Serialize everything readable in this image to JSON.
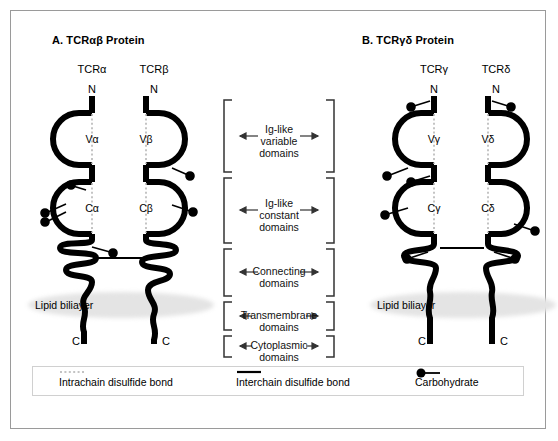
{
  "figure": {
    "panels": [
      {
        "id": "A",
        "title": "A.  TCRαβ Protein",
        "chains": [
          {
            "name": "TCRα",
            "n_terminus": "N",
            "c_terminus": "C",
            "variable_domain": "Vα",
            "constant_domain": "Cα"
          },
          {
            "name": "TCRβ",
            "n_terminus": "N",
            "c_terminus": "C",
            "variable_domain": "Vβ",
            "constant_domain": "Cβ"
          }
        ],
        "membrane_label": "Lipid biliayer"
      },
      {
        "id": "B",
        "title": "B.  TCRγδ Protein",
        "chains": [
          {
            "name": "TCRγ",
            "n_terminus": "N",
            "c_terminus": "C",
            "variable_domain": "Vγ",
            "constant_domain": "Cγ"
          },
          {
            "name": "TCRδ",
            "n_terminus": "N",
            "c_terminus": "C",
            "variable_domain": "Vδ",
            "constant_domain": "Cδ"
          }
        ],
        "membrane_label": "Lipid biliayer"
      }
    ],
    "domain_annotations": [
      {
        "line1": "Ig-like",
        "line2": "variable",
        "line3": "domains"
      },
      {
        "line1": "Ig-like",
        "line2": "constant",
        "line3": "domains"
      },
      {
        "line1": "Connecting",
        "line2": "domains",
        "line3": ""
      },
      {
        "line1": "Transmembrane",
        "line2": "domains",
        "line3": ""
      },
      {
        "line1": "Cytoplasmic",
        "line2": "domains",
        "line3": ""
      }
    ],
    "legend": [
      {
        "symbol": "dotted-line",
        "label": "Intrachain disulfide bond"
      },
      {
        "symbol": "solid-line",
        "label": "Interchain disulfide bond"
      },
      {
        "symbol": "filled-circle-stem",
        "label": "Carbohydrate"
      }
    ],
    "colors": {
      "chain_stroke": "#000000",
      "membrane_band": "#e4e4e4",
      "frame_border": "#9a9a9a",
      "intrachain_bond": "#b0b0b0"
    }
  }
}
